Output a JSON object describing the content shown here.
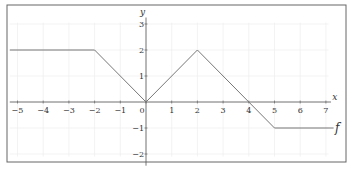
{
  "chart_data": {
    "type": "line",
    "title": "",
    "xlabel": "x",
    "ylabel": "y",
    "xlim": [
      -5.3,
      7.3
    ],
    "ylim": [
      -2.5,
      3.2
    ],
    "grid": true,
    "x_ticks": [
      -5,
      -4,
      -3,
      -2,
      -1,
      0,
      1,
      2,
      3,
      4,
      5,
      6,
      7
    ],
    "y_ticks": [
      -2,
      -1,
      1,
      2,
      3
    ],
    "x_tick_labels": [
      "−5",
      "−4",
      "−3",
      "−2",
      "−1",
      "0",
      "1",
      "2",
      "3",
      "4",
      "5",
      "6",
      "7"
    ],
    "y_tick_labels": [
      "−2",
      "−1",
      "1",
      "2",
      "3"
    ],
    "series": [
      {
        "name": "f",
        "x": [
          -5.3,
          -2,
          0,
          2,
          4,
          5,
          7.3
        ],
        "y": [
          2,
          2,
          0,
          2,
          0,
          -1,
          -1
        ]
      }
    ],
    "annotations": [
      {
        "text": "f",
        "at": [
          7.3,
          -1
        ]
      }
    ]
  },
  "colors": {
    "line": "#777777",
    "axis": "#555555",
    "grid": "#eeeeee",
    "frame": "#666666"
  }
}
